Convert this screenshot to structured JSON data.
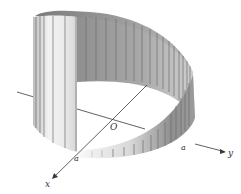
{
  "figure": {
    "labels": {
      "origin": "O",
      "x_axis": "x",
      "y_axis": "y",
      "a_on_x": "a",
      "a_on_y": "a"
    },
    "colors": {
      "surface_dark": "#8c8c8c",
      "surface_mid": "#b4b4b4",
      "surface_light": "#ececec",
      "rib": "#6d6d6d",
      "axis": "#3a3a3a",
      "background": "#ffffff"
    }
  }
}
